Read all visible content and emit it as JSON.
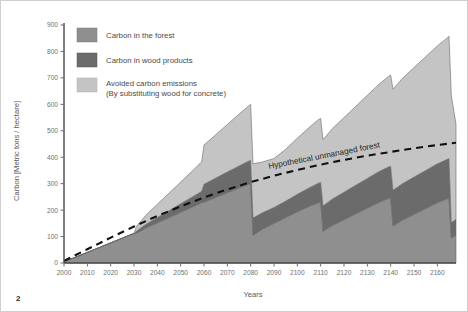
{
  "figure": {
    "page_number": "2",
    "background_color": "#ffffff",
    "border_color": "#cfcfcf"
  },
  "legend": {
    "position": "top-left-inside",
    "items": [
      {
        "label": "Carbon in the forest",
        "color": "#8f8f8f",
        "key": "forest"
      },
      {
        "label": "Carbon in wood products",
        "color": "#6b6b6b",
        "key": "wood_products"
      },
      {
        "label": "Avoided carbon emissions",
        "label_line2": "(By substituting wood for concrete)",
        "color": "#c4c4c4",
        "key": "avoided_emissions"
      }
    ]
  },
  "annotations": [
    {
      "text": "Hypothetical unmanaged forest",
      "name": "unmanaged-forest-label",
      "color": "#111111"
    }
  ],
  "axes": {
    "y": {
      "title": "Carbon [Metric tons / hectare]",
      "min": 0,
      "max": 900,
      "step": 100,
      "ticks": [
        "0",
        "100",
        "200",
        "300",
        "400",
        "500",
        "600",
        "700",
        "800",
        "900"
      ]
    },
    "x": {
      "title": "Years",
      "min": 2000,
      "max": 2168,
      "step": 10,
      "ticks": [
        "2000",
        "2010",
        "2020",
        "2030",
        "2040",
        "2050",
        "2060",
        "2070",
        "2080",
        "2090",
        "2100",
        "2110",
        "2120",
        "2130",
        "2140",
        "2150",
        "2160"
      ]
    }
  },
  "chart_data": {
    "type": "area",
    "title": "",
    "subtitle": "",
    "xlabel": "Years",
    "ylabel": "Carbon [Metric tons / hectare]",
    "xlim": [
      2000,
      2168
    ],
    "ylim": [
      0,
      900
    ],
    "grid": false,
    "stacked": true,
    "legend_position": "top-left",
    "x": [
      2000,
      2005,
      2010,
      2015,
      2020,
      2025,
      2030,
      2031,
      2035,
      2040,
      2045,
      2050,
      2055,
      2059,
      2060,
      2065,
      2070,
      2075,
      2079,
      2080,
      2081,
      2085,
      2090,
      2095,
      2100,
      2105,
      2109,
      2110,
      2111,
      2115,
      2120,
      2125,
      2130,
      2135,
      2139,
      2140,
      2141,
      2145,
      2150,
      2155,
      2160,
      2164,
      2165,
      2166,
      2168
    ],
    "series": [
      {
        "name": "Carbon in the forest",
        "color": "#8f8f8f",
        "values": [
          5,
          22,
          40,
          58,
          76,
          94,
          112,
          112,
          132,
          152,
          172,
          192,
          212,
          228,
          230,
          248,
          266,
          284,
          298,
          300,
          105,
          128,
          150,
          172,
          194,
          214,
          228,
          230,
          120,
          142,
          164,
          186,
          208,
          230,
          244,
          246,
          140,
          162,
          184,
          206,
          228,
          242,
          245,
          95,
          105
        ]
      },
      {
        "name": "Carbon in wood products",
        "color": "#6b6b6b",
        "values": [
          0,
          0,
          0,
          0,
          0,
          0,
          0,
          8,
          14,
          20,
          26,
          32,
          38,
          43,
          68,
          73,
          78,
          83,
          87,
          88,
          65,
          62,
          60,
          62,
          66,
          70,
          74,
          75,
          96,
          100,
          104,
          108,
          112,
          116,
          119,
          120,
          135,
          138,
          141,
          144,
          147,
          149,
          150,
          58,
          60
        ]
      },
      {
        "name": "Avoided carbon emissions",
        "color": "#c4c4c4",
        "values": [
          0,
          0,
          0,
          0,
          0,
          0,
          0,
          18,
          34,
          50,
          66,
          82,
          98,
          112,
          148,
          164,
          180,
          196,
          208,
          212,
          205,
          192,
          185,
          196,
          212,
          228,
          240,
          242,
          250,
          266,
          282,
          298,
          314,
          330,
          342,
          345,
          382,
          398,
          414,
          430,
          446,
          458,
          462,
          480,
          360
        ]
      }
    ],
    "reference_line": {
      "name": "Hypothetical unmanaged forest",
      "style": "dashed",
      "color": "#111111",
      "x": [
        2000,
        2010,
        2020,
        2030,
        2040,
        2050,
        2060,
        2070,
        2080,
        2090,
        2100,
        2110,
        2120,
        2130,
        2140,
        2150,
        2160,
        2168
      ],
      "y": [
        8,
        52,
        96,
        138,
        178,
        214,
        248,
        278,
        306,
        330,
        352,
        372,
        390,
        406,
        420,
        434,
        446,
        455
      ]
    }
  }
}
